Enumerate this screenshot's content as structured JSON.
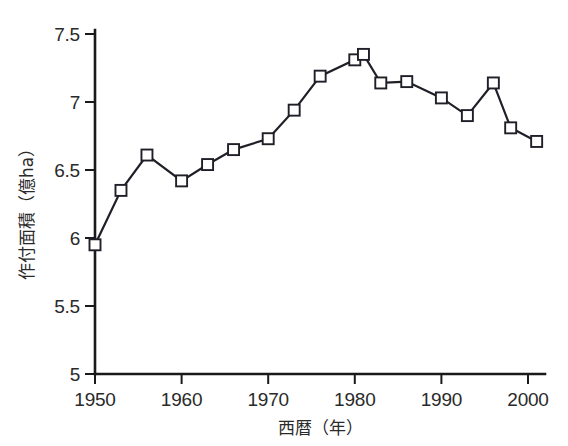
{
  "chart_data": {
    "type": "line",
    "title": "",
    "xlabel": "西暦（年）",
    "ylabel": "作付面積（億ha）",
    "xlim": [
      1948,
      2003
    ],
    "ylim": [
      5,
      7.5
    ],
    "xticks": [
      1950,
      1960,
      1970,
      1980,
      1990,
      2000
    ],
    "xtick_labels": [
      "1950",
      "1960",
      "1970",
      "1980",
      "1990",
      "2000"
    ],
    "yticks": [
      5,
      5.5,
      6,
      6.5,
      7,
      7.5
    ],
    "ytick_labels": [
      "5",
      "5.5",
      "6",
      "6.5",
      "7",
      "7.5"
    ],
    "grid": false,
    "legend": false,
    "marker": "open-square",
    "line_color": "#1f1f28",
    "marker_fill": "#ffffff",
    "background": "#ffffff",
    "x": [
      1950,
      1953,
      1956,
      1960,
      1963,
      1966,
      1970,
      1973,
      1976,
      1980,
      1981,
      1983,
      1986,
      1990,
      1993,
      1996,
      1998,
      2001
    ],
    "values": [
      5.95,
      6.35,
      6.61,
      6.42,
      6.54,
      6.65,
      6.73,
      6.94,
      7.19,
      7.31,
      7.35,
      7.14,
      7.15,
      7.03,
      6.9,
      7.14,
      6.81,
      6.71
    ],
    "series": [
      {
        "name": "作付面積",
        "values": [
          5.95,
          6.35,
          6.61,
          6.42,
          6.54,
          6.65,
          6.73,
          6.94,
          7.19,
          7.31,
          7.35,
          7.14,
          7.15,
          7.03,
          6.9,
          7.14,
          6.81,
          6.71
        ]
      }
    ]
  }
}
